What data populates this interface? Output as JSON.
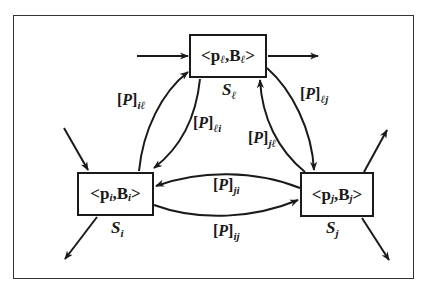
{
  "diagram": {
    "type": "state-transition",
    "nodes": {
      "l": {
        "content_prefix": "<p",
        "content_sub1": "ℓ",
        "content_mid": ",B",
        "content_sub2": "ℓ",
        "content_suffix": ">",
        "state_symbol": "S",
        "state_sub": "ℓ"
      },
      "i": {
        "content_prefix": "<p",
        "content_sub1": "i",
        "content_mid": ",B",
        "content_sub2": "i",
        "content_suffix": ">",
        "state_symbol": "S",
        "state_sub": "i"
      },
      "j": {
        "content_prefix": "<p",
        "content_sub1": "j",
        "content_mid": ",B",
        "content_sub2": "j",
        "content_suffix": ">",
        "state_symbol": "S",
        "state_sub": "j"
      }
    },
    "edges": {
      "il": {
        "bracket_open": "[",
        "symbol": "P",
        "bracket_close": "]",
        "sub": "iℓ",
        "from": "S_i",
        "to": "S_ℓ"
      },
      "li": {
        "bracket_open": "[",
        "symbol": "P",
        "bracket_close": "]",
        "sub": "ℓi",
        "from": "S_ℓ",
        "to": "S_i"
      },
      "lj": {
        "bracket_open": "[",
        "symbol": "P",
        "bracket_close": "]",
        "sub": "ℓj",
        "from": "S_ℓ",
        "to": "S_j"
      },
      "jl": {
        "bracket_open": "[",
        "symbol": "P",
        "bracket_close": "]",
        "sub": "jℓ",
        "from": "S_j",
        "to": "S_ℓ"
      },
      "ji": {
        "bracket_open": "[",
        "symbol": "P",
        "bracket_close": "]",
        "sub": "ji",
        "from": "S_j",
        "to": "S_i"
      },
      "ij": {
        "bracket_open": "[",
        "symbol": "P",
        "bracket_close": "]",
        "sub": "ij",
        "from": "S_i",
        "to": "S_j"
      }
    },
    "colors": {
      "stroke": "#1a1a1a",
      "background": "#ffffff",
      "frame": "#333333"
    }
  }
}
